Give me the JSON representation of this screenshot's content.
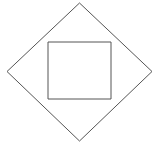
{
  "figure": {
    "background_color": "#ffffff",
    "stroke_color": "#555555",
    "stroke_width": 1,
    "canvas": {
      "width": 161,
      "height": 145
    },
    "shapes": {
      "diamond": {
        "name": "outer-diamond",
        "points": "79.5,3 152,71.5 79.5,141 7,71.5",
        "vertices": [
          {
            "label": "top",
            "x": 79.5,
            "y": 3
          },
          {
            "label": "right",
            "x": 152,
            "y": 71.5
          },
          {
            "label": "bottom",
            "x": 79.5,
            "y": 141
          },
          {
            "label": "left",
            "x": 7,
            "y": 71.5
          }
        ]
      },
      "square": {
        "name": "inner-square",
        "points": "48,42 111,42 111,99 48,99",
        "x": 48,
        "y": 42,
        "width": 63,
        "height": 57,
        "vertices": [
          {
            "label": "top-left",
            "x": 48,
            "y": 42
          },
          {
            "label": "top-right",
            "x": 111,
            "y": 42
          },
          {
            "label": "bottom-right",
            "x": 111,
            "y": 99
          },
          {
            "label": "bottom-left",
            "x": 48,
            "y": 99
          }
        ]
      }
    }
  }
}
